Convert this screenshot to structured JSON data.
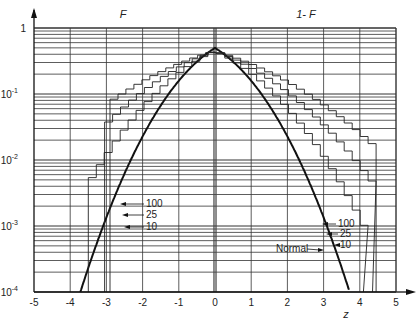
{
  "chart_data": {
    "type": "line",
    "title": "",
    "header_labels": {
      "left": "F",
      "right": "1- F"
    },
    "xlabel": "z",
    "ylabel": "",
    "xlim": [
      -5,
      5
    ],
    "ylim": [
      0.0001,
      1
    ],
    "yscale": "log",
    "x_ticks": [
      "-5",
      "-4",
      "-3",
      "-2",
      "-1",
      "0",
      "1",
      "2",
      "3",
      "4",
      "5"
    ],
    "y_ticks": [
      {
        "base": "1",
        "exp": ""
      },
      {
        "base": "10",
        "exp": "-1"
      },
      {
        "base": "10",
        "exp": "-2"
      },
      {
        "base": "10",
        "exp": "-3"
      },
      {
        "base": "10",
        "exp": "-4"
      }
    ],
    "grid": true,
    "series": [
      {
        "name": "Normal",
        "kind": "smooth",
        "description": "F(z) for z<0 and 1-F(z) for z>0 of standard normal"
      },
      {
        "name": "100",
        "kind": "step"
      },
      {
        "name": "25",
        "kind": "step"
      },
      {
        "name": "10",
        "kind": "step"
      }
    ],
    "annotations": {
      "left": [
        "100",
        "25",
        "10"
      ],
      "right": [
        "100",
        "25",
        "10"
      ],
      "normal_label": "Normal"
    },
    "step_tails": {
      "left_end_z": {
        "100": -3.5,
        "25": -3.05,
        "10": -2.9
      },
      "right_end_z": {
        "100": 4.1,
        "25": 4.35,
        "10": 4.45
      }
    }
  }
}
